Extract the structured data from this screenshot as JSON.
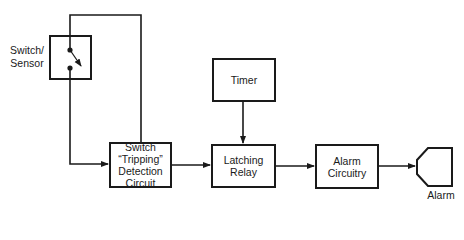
{
  "diagram": {
    "line_color": "#1a1a1a",
    "nodes": {
      "switch_sensor": {
        "label_line1": "Switch/",
        "label_line2": "Sensor"
      },
      "detection": {
        "line1": "Switch",
        "line2": "“Tripping”",
        "line3": "Detection",
        "line4": "Circuit"
      },
      "timer": {
        "label": "Timer"
      },
      "latching_relay": {
        "line1": "Latching",
        "line2": "Relay"
      },
      "alarm_circuitry": {
        "line1": "Alarm",
        "line2": "Circuitry"
      },
      "alarm": {
        "label": "Alarm"
      }
    },
    "edges": [
      {
        "from": "switch_sensor",
        "to": "detection",
        "note": "bottom contact to detection input"
      },
      {
        "from": "switch_sensor",
        "to": "detection",
        "note": "top contact loop to detection top"
      },
      {
        "from": "detection",
        "to": "latching_relay"
      },
      {
        "from": "timer",
        "to": "latching_relay"
      },
      {
        "from": "latching_relay",
        "to": "alarm_circuitry"
      },
      {
        "from": "alarm_circuitry",
        "to": "alarm"
      }
    ]
  }
}
